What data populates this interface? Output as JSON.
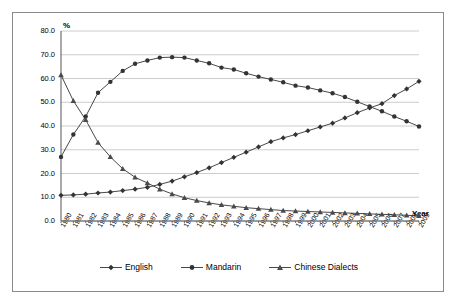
{
  "chart_data": {
    "type": "line",
    "title": "",
    "xlabel": "Year",
    "ylabel": "%",
    "ylim": [
      0,
      80
    ],
    "yticks": [
      "0.0",
      "10.0",
      "20.0",
      "30.0",
      "40.0",
      "50.0",
      "60.0",
      "70.0",
      "80.0"
    ],
    "grid": true,
    "legend_position": "bottom",
    "categories": [
      "1980",
      "1981",
      "1982",
      "1983",
      "1984",
      "1985",
      "1986",
      "1987",
      "1988",
      "1989",
      "1990",
      "1991",
      "1992",
      "1993",
      "1994",
      "1995",
      "1996",
      "1997",
      "1998",
      "1999",
      "2000",
      "2001",
      "2002",
      "2003",
      "2004",
      "2005",
      "2006",
      "2007",
      "2008",
      "2009"
    ],
    "series": [
      {
        "name": "English",
        "marker": "diamond",
        "values": [
          10.8,
          11.0,
          11.3,
          11.8,
          12.2,
          12.8,
          13.4,
          14.2,
          15.4,
          16.8,
          18.6,
          20.4,
          22.4,
          24.6,
          26.8,
          29.0,
          31.2,
          33.4,
          35.0,
          36.4,
          38.0,
          39.6,
          41.2,
          43.4,
          45.6,
          47.6,
          49.4,
          52.8,
          55.6,
          58.8
        ]
      },
      {
        "name": "Mandarin",
        "marker": "circle",
        "values": [
          27.0,
          36.4,
          44.0,
          54.0,
          58.6,
          63.2,
          66.2,
          67.6,
          68.8,
          69.0,
          68.8,
          67.6,
          66.4,
          64.6,
          63.8,
          62.2,
          60.8,
          59.6,
          58.4,
          57.0,
          56.2,
          55.0,
          53.8,
          52.2,
          50.2,
          48.2,
          46.2,
          44.0,
          42.0,
          39.8
        ]
      },
      {
        "name": "Chinese Dialects",
        "marker": "triangle",
        "values": [
          61.5,
          50.6,
          42.6,
          33.0,
          27.0,
          22.0,
          18.4,
          16.0,
          13.4,
          11.4,
          9.8,
          8.6,
          7.6,
          6.8,
          6.2,
          5.6,
          5.2,
          4.8,
          4.4,
          4.2,
          4.0,
          3.8,
          3.6,
          3.4,
          3.2,
          3.0,
          2.8,
          2.6,
          2.4,
          2.2
        ]
      }
    ]
  },
  "colors": {
    "series_line": "#333333",
    "grid": "#bfbfbf",
    "axis": "#555555",
    "frame": "#8a8a8a"
  }
}
